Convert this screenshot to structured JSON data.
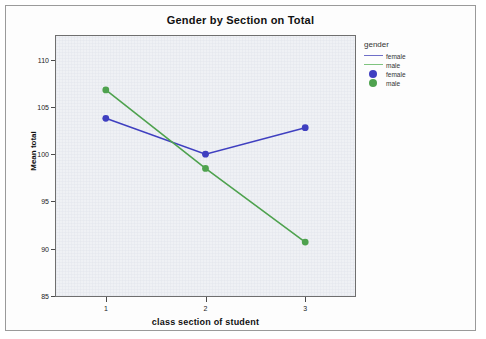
{
  "chart_data": {
    "type": "line",
    "title": "Gender by Section on Total",
    "xlabel": "class section of student",
    "ylabel": "Mean total",
    "categories": [
      "1",
      "2",
      "3"
    ],
    "x": [
      1,
      2,
      3
    ],
    "series": [
      {
        "name": "female",
        "values": [
          103.8,
          100.0,
          102.8
        ],
        "color": "#3f3fc0",
        "marker": "circle"
      },
      {
        "name": "male",
        "values": [
          106.8,
          98.5,
          90.7
        ],
        "color": "#4ea24e",
        "marker": "circle"
      }
    ],
    "yticks": [
      110,
      105,
      100,
      95,
      90,
      85
    ],
    "ylim": [
      85,
      112.5
    ],
    "xlim": [
      0.5,
      3.5
    ],
    "grid": false,
    "legend_position": "right",
    "legend_title": "gender",
    "legend_entries": [
      {
        "label": "female",
        "type": "line",
        "color": "#6f6fc8"
      },
      {
        "label": "male",
        "type": "line",
        "color": "#7fc47f"
      },
      {
        "label": "female",
        "type": "marker",
        "color": "#3f3fc0"
      },
      {
        "label": "male",
        "type": "marker",
        "color": "#4ea24e"
      }
    ],
    "plot_background": "#e7eaef"
  }
}
